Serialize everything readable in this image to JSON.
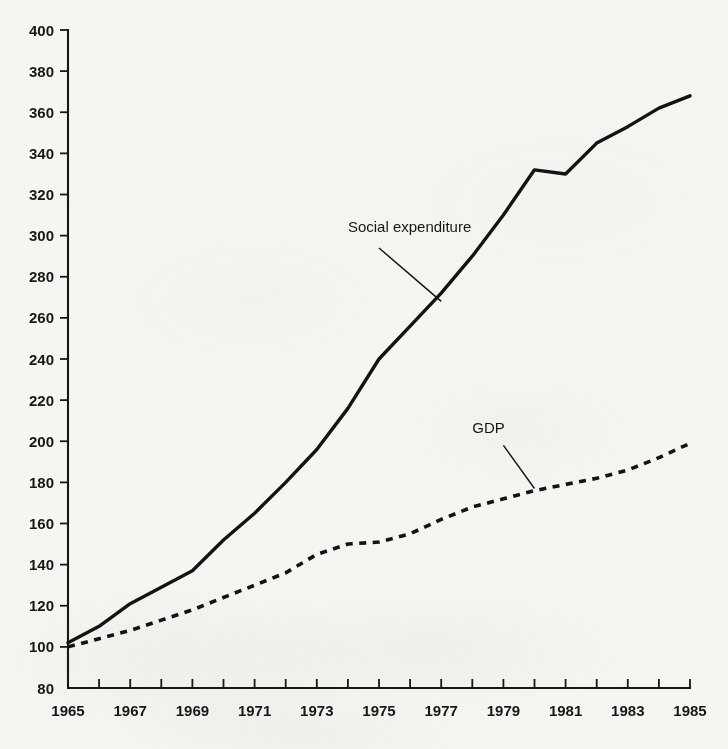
{
  "chart_data": {
    "type": "line",
    "title": "",
    "subtitle": "",
    "xlabel": "",
    "ylabel": "",
    "xlim": [
      1965,
      1985
    ],
    "ylim": [
      80,
      400
    ],
    "grid": false,
    "legend_position": "inline-annotation",
    "index_note": "index, 1965 = 100",
    "x": [
      1965,
      1966,
      1967,
      1968,
      1969,
      1970,
      1971,
      1972,
      1973,
      1974,
      1975,
      1976,
      1977,
      1978,
      1979,
      1980,
      1981,
      1982,
      1983,
      1984,
      1985
    ],
    "y_ticks": [
      80,
      100,
      120,
      140,
      160,
      180,
      200,
      220,
      240,
      260,
      280,
      300,
      320,
      340,
      360,
      380,
      400
    ],
    "y_tick_labels": [
      "80",
      "100",
      "120",
      "140",
      "160",
      "180",
      "200",
      "220",
      "240",
      "260",
      "280",
      "300",
      "320",
      "340",
      "360",
      "380",
      "400"
    ],
    "x_ticks": [
      1965,
      1966,
      1967,
      1968,
      1969,
      1970,
      1971,
      1972,
      1973,
      1974,
      1975,
      1976,
      1977,
      1978,
      1979,
      1980,
      1981,
      1982,
      1983,
      1984,
      1985
    ],
    "x_tick_labels": [
      "1965",
      "",
      "1967",
      "",
      "1969",
      "",
      "1971",
      "",
      "1973",
      "",
      "1975",
      "",
      "1977",
      "",
      "1979",
      "",
      "1981",
      "",
      "1983",
      "",
      "1985"
    ],
    "series": [
      {
        "name": "Social expenditure",
        "style": "solid",
        "color": "#131316",
        "label_x": 1974,
        "label_y": 302,
        "values": [
          102,
          110,
          121,
          129,
          137,
          152,
          165,
          180,
          196,
          216,
          240,
          256,
          272,
          290,
          310,
          332,
          330,
          345,
          353,
          362,
          368
        ]
      },
      {
        "name": "GDP",
        "style": "dashed",
        "color": "#131316",
        "label_x": 1978,
        "label_y": 204,
        "values": [
          100,
          104,
          108,
          113,
          118,
          124,
          130,
          136,
          145,
          150,
          151,
          155,
          162,
          168,
          172,
          176,
          179,
          182,
          186,
          192,
          199
        ]
      }
    ],
    "annotations": [
      {
        "text": "Social expenditure",
        "label_x": 1974,
        "label_y": 302,
        "leader_from_x": 1975,
        "leader_from_y": 294,
        "leader_to_x": 1977,
        "leader_to_y": 268
      },
      {
        "text": "GDP",
        "label_x": 1978,
        "label_y": 204,
        "leader_from_x": 1979,
        "leader_from_y": 198,
        "leader_to_x": 1980,
        "leader_to_y": 177
      }
    ]
  },
  "figure": {
    "background_color": "#f6f5f2",
    "ink_color": "#131316"
  }
}
